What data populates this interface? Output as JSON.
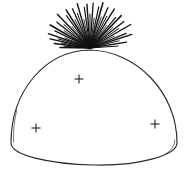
{
  "figure": {
    "background_color": "#ffffff",
    "stroke_color": "#2a2a2a",
    "tuft_color": "#111111",
    "mark_color": "#222222",
    "canvas": {
      "width": 188,
      "height": 173
    }
  },
  "chart_data": {
    "type": "scatter",
    "xlabel": "",
    "ylabel": "",
    "xlim": [
      0,
      188
    ],
    "ylim": [
      0,
      173
    ],
    "grid": false,
    "legend": null,
    "dome": {
      "apex": [
        90,
        50
      ],
      "left_base": [
        11,
        143
      ],
      "right_base": [
        177,
        143
      ],
      "bottom_mid": [
        94,
        165
      ],
      "outline_path": "M 11 143 C 11 92, 44 51, 90 50 C 136 51, 177 92, 177 143 C 177 155, 140 166, 94 165 C 48 164, 11 155, 11 143 Z",
      "inner_shade_paths": [
        "M 13.6 142.0 C 13.2 130.0, 14.2 120.0, 16.8 110.0",
        "M 174.6 140.0 C 174.8 146.0, 171.0 151.5, 163.0 155.5"
      ]
    },
    "tuft": {
      "origin": [
        90,
        48
      ],
      "ray_count": 46,
      "angle_range_deg": [
        178,
        2
      ],
      "length_range_px": [
        22,
        48
      ],
      "rays": [
        {
          "angle_deg": 179,
          "length": 30,
          "width": 1.4
        },
        {
          "angle_deg": 176,
          "length": 26,
          "width": 1.0
        },
        {
          "angle_deg": 173,
          "length": 36,
          "width": 1.5
        },
        {
          "angle_deg": 170,
          "length": 29,
          "width": 0.9
        },
        {
          "angle_deg": 167,
          "length": 41,
          "width": 1.3
        },
        {
          "angle_deg": 164,
          "length": 33,
          "width": 1.0
        },
        {
          "angle_deg": 161,
          "length": 44,
          "width": 1.4
        },
        {
          "angle_deg": 158,
          "length": 27,
          "width": 0.8
        },
        {
          "angle_deg": 154,
          "length": 39,
          "width": 1.2
        },
        {
          "angle_deg": 150,
          "length": 46,
          "width": 1.5
        },
        {
          "angle_deg": 146,
          "length": 31,
          "width": 0.9
        },
        {
          "angle_deg": 142,
          "length": 42,
          "width": 1.3
        },
        {
          "angle_deg": 138,
          "length": 35,
          "width": 1.0
        },
        {
          "angle_deg": 134,
          "length": 47,
          "width": 1.4
        },
        {
          "angle_deg": 130,
          "length": 28,
          "width": 0.8
        },
        {
          "angle_deg": 126,
          "length": 40,
          "width": 1.2
        },
        {
          "angle_deg": 122,
          "length": 45,
          "width": 1.5
        },
        {
          "angle_deg": 118,
          "length": 32,
          "width": 0.9
        },
        {
          "angle_deg": 114,
          "length": 43,
          "width": 1.3
        },
        {
          "angle_deg": 110,
          "length": 37,
          "width": 1.0
        },
        {
          "angle_deg": 106,
          "length": 46,
          "width": 1.4
        },
        {
          "angle_deg": 102,
          "length": 29,
          "width": 0.8
        },
        {
          "angle_deg": 98,
          "length": 41,
          "width": 1.2
        },
        {
          "angle_deg": 94,
          "length": 44,
          "width": 1.4
        },
        {
          "angle_deg": 90,
          "length": 34,
          "width": 1.0
        },
        {
          "angle_deg": 86,
          "length": 45,
          "width": 1.3
        },
        {
          "angle_deg": 82,
          "length": 30,
          "width": 0.9
        },
        {
          "angle_deg": 78,
          "length": 42,
          "width": 1.2
        },
        {
          "angle_deg": 74,
          "length": 47,
          "width": 1.5
        },
        {
          "angle_deg": 70,
          "length": 33,
          "width": 0.9
        },
        {
          "angle_deg": 66,
          "length": 44,
          "width": 1.3
        },
        {
          "angle_deg": 62,
          "length": 36,
          "width": 1.0
        },
        {
          "angle_deg": 58,
          "length": 46,
          "width": 1.4
        },
        {
          "angle_deg": 54,
          "length": 28,
          "width": 0.8
        },
        {
          "angle_deg": 50,
          "length": 40,
          "width": 1.2
        },
        {
          "angle_deg": 46,
          "length": 45,
          "width": 1.5
        },
        {
          "angle_deg": 42,
          "length": 31,
          "width": 0.9
        },
        {
          "angle_deg": 38,
          "length": 43,
          "width": 1.3
        },
        {
          "angle_deg": 34,
          "length": 35,
          "width": 1.0
        },
        {
          "angle_deg": 30,
          "length": 47,
          "width": 1.4
        },
        {
          "angle_deg": 26,
          "length": 27,
          "width": 0.8
        },
        {
          "angle_deg": 22,
          "length": 39,
          "width": 1.2
        },
        {
          "angle_deg": 18,
          "length": 44,
          "width": 1.4
        },
        {
          "angle_deg": 14,
          "length": 30,
          "width": 0.9
        },
        {
          "angle_deg": 9,
          "length": 37,
          "width": 1.3
        },
        {
          "angle_deg": 4,
          "length": 28,
          "width": 1.0
        }
      ]
    },
    "plus_marks": [
      {
        "id": "plus-upper-center",
        "x": 79,
        "y": 79,
        "size": 9
      },
      {
        "id": "plus-lower-left",
        "x": 36,
        "y": 128,
        "size": 9
      },
      {
        "id": "plus-lower-right",
        "x": 155,
        "y": 124,
        "size": 9
      }
    ]
  }
}
